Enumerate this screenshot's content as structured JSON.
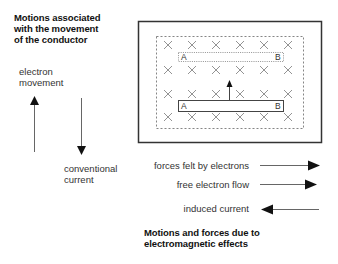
{
  "left_panel": {
    "title_lines": [
      "Motions associated",
      "with the movement",
      "of the conductor"
    ],
    "electron_label_lines": [
      "electron",
      "movement"
    ],
    "conventional_label_lines": [
      "conventional",
      "current"
    ],
    "electron_arrow": {
      "direction": "up"
    },
    "conventional_arrow": {
      "direction": "down"
    }
  },
  "field_diagram": {
    "field_symbol": "×",
    "field_rows": 4,
    "field_cols": 6,
    "dotted_conductor": {
      "left_label": "A",
      "right_label": "B",
      "style": "dotted",
      "meaning": "previous position"
    },
    "solid_conductor": {
      "left_label": "A",
      "right_label": "B",
      "style": "solid"
    },
    "motion_arrow": {
      "direction": "up"
    }
  },
  "legend": {
    "items": [
      {
        "label": "forces felt by electrons",
        "direction": "right"
      },
      {
        "label": "free electron flow",
        "direction": "right"
      },
      {
        "label": "induced current",
        "direction": "left"
      }
    ]
  },
  "bottom_caption": {
    "lines": [
      "Motions and forces due to",
      "electromagnetic effects"
    ]
  },
  "colors": {
    "outline": "#333333",
    "field_x": "#777777",
    "text": "#333333",
    "title": "#111111"
  }
}
